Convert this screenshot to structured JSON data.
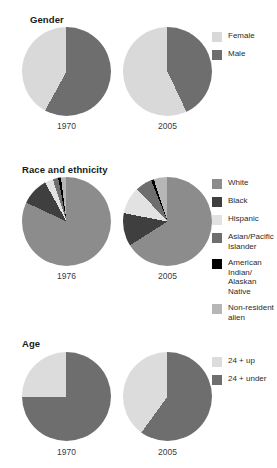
{
  "colors": {
    "white_race": "#8c8c8c",
    "black_race": "#3f3f3f",
    "hispanic": "#e2e2e2",
    "asian_pacific": "#6e6e6e",
    "american_indian": "#000000",
    "non_resident": "#b6b6b6",
    "female": "#d9d9d9",
    "male": "#6e6e6e",
    "age_up": "#dcdcdc",
    "age_under": "#6e6e6e",
    "background": "#ffffff",
    "text": "#231f20"
  },
  "sections": [
    {
      "id": "gender",
      "title": "Gender",
      "charts": [
        {
          "year": "1970"
        },
        {
          "year": "2005"
        }
      ],
      "legend": [
        {
          "label": "Female",
          "color_key": "female"
        },
        {
          "label": "Male",
          "color_key": "male"
        }
      ]
    },
    {
      "id": "race-and-ethnicity",
      "title": "Race and ethnicity",
      "charts": [
        {
          "year": "1976"
        },
        {
          "year": "2005"
        }
      ],
      "legend": [
        {
          "label": "White",
          "color_key": "white_race"
        },
        {
          "label": "Black",
          "color_key": "black_race"
        },
        {
          "label": "Hispanic",
          "color_key": "hispanic"
        },
        {
          "label": "Asian/Pacific\nIslander",
          "color_key": "asian_pacific"
        },
        {
          "label": "American\nIndian/\nAlaskan\nNative",
          "color_key": "american_indian"
        },
        {
          "label": "Non-resident\nalien",
          "color_key": "non_resident"
        }
      ]
    },
    {
      "id": "age",
      "title": "Age",
      "charts": [
        {
          "year": "1970"
        },
        {
          "year": "2005"
        }
      ],
      "legend": [
        {
          "label": "24 + up",
          "color_key": "age_up"
        },
        {
          "label": "24 + under",
          "color_key": "age_under"
        }
      ]
    }
  ],
  "chart_data": [
    {
      "type": "pie",
      "title": "Gender",
      "subtitle": "1970",
      "categories": [
        "Male",
        "Female"
      ],
      "values": [
        58,
        42
      ],
      "colors": [
        "#6e6e6e",
        "#d9d9d9"
      ],
      "start_angle": 0,
      "direction": "clockwise",
      "legend_position": "right"
    },
    {
      "type": "pie",
      "title": "Gender",
      "subtitle": "2005",
      "categories": [
        "Male",
        "Female"
      ],
      "values": [
        43,
        57
      ],
      "colors": [
        "#6e6e6e",
        "#d9d9d9"
      ],
      "start_angle": 0,
      "direction": "clockwise",
      "legend_position": "right"
    },
    {
      "type": "pie",
      "title": "Race and ethnicity",
      "subtitle": "1976",
      "categories": [
        "White",
        "Black",
        "Hispanic",
        "Asian/Pacific Islander",
        "American Indian/Alaskan Native",
        "Non-resident alien"
      ],
      "values": [
        82,
        10,
        3,
        2,
        1,
        2
      ],
      "colors": [
        "#8c8c8c",
        "#3f3f3f",
        "#e2e2e2",
        "#6e6e6e",
        "#000000",
        "#b6b6b6"
      ],
      "start_angle": 0,
      "direction": "clockwise",
      "legend_position": "right"
    },
    {
      "type": "pie",
      "title": "Race and ethnicity",
      "subtitle": "2005",
      "categories": [
        "White",
        "Black",
        "Hispanic",
        "Asian/Pacific Islander",
        "American Indian/Alaskan Native",
        "Non-resident alien"
      ],
      "values": [
        66,
        12,
        10,
        6,
        1,
        5
      ],
      "colors": [
        "#8c8c8c",
        "#3f3f3f",
        "#e2e2e2",
        "#6e6e6e",
        "#000000",
        "#b6b6b6"
      ],
      "start_angle": 0,
      "direction": "clockwise",
      "legend_position": "right"
    },
    {
      "type": "pie",
      "title": "Age",
      "subtitle": "1970",
      "categories": [
        "24 + under",
        "24 + up"
      ],
      "values": [
        75,
        25
      ],
      "colors": [
        "#6e6e6e",
        "#dcdcdc"
      ],
      "start_angle": 0,
      "direction": "clockwise",
      "legend_position": "right"
    },
    {
      "type": "pie",
      "title": "Age",
      "subtitle": "2005",
      "categories": [
        "24 + under",
        "24 + up"
      ],
      "values": [
        60,
        40
      ],
      "colors": [
        "#6e6e6e",
        "#dcdcdc"
      ],
      "start_angle": 0,
      "direction": "clockwise",
      "legend_position": "right"
    }
  ]
}
